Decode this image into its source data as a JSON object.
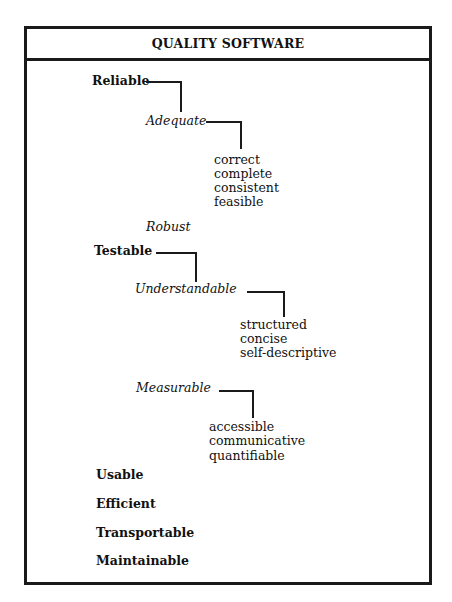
{
  "title": "QUALITY SOFTWARE",
  "tree": {
    "reliable": {
      "label": "Reliable",
      "adequate": {
        "label": "Adequate",
        "children": [
          "correct",
          "complete",
          "consistent",
          "feasible"
        ]
      },
      "robust": {
        "label": "Robust"
      }
    },
    "testable": {
      "label": "Testable",
      "understandable": {
        "label": "Understandable",
        "children": [
          "structured",
          "concise",
          "self-descriptive"
        ]
      },
      "measurable": {
        "label": "Measurable",
        "children": [
          "accessible",
          "communicative",
          "quantifiable"
        ]
      }
    },
    "usable": {
      "label": "Usable"
    },
    "efficient": {
      "label": "Efficient"
    },
    "transportable": {
      "label": "Transportable"
    },
    "maintainable": {
      "label": "Maintainable"
    }
  }
}
